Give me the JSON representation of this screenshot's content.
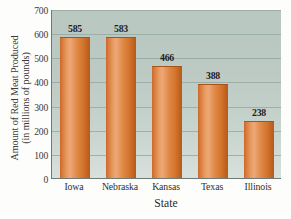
{
  "chart_data": {
    "type": "bar",
    "title": "",
    "categories": [
      "Iowa",
      "Nebraska",
      "Kansas",
      "Texas",
      "Illinois"
    ],
    "values": [
      585,
      583,
      466,
      388,
      238
    ],
    "xlabel": "State",
    "ylabel": "Amount of Red Meat Produced (in millions of pounds)",
    "ylabel_line1": "Amount of Red Meat Produced",
    "ylabel_line2": "(in millions of pounds)",
    "ylim": [
      0,
      700
    ],
    "ytick_labels": [
      "0",
      "100",
      "200",
      "300",
      "400",
      "500",
      "600",
      "700"
    ],
    "ytick_values": [
      0,
      100,
      200,
      300,
      400,
      500,
      600,
      700
    ],
    "grid": true,
    "legend": "none",
    "bar_color": "#d9803f",
    "plot_background_color": "#bccac3",
    "gridline_color": "#98a8a2",
    "axis_color": "#6f7a76",
    "value_labels": [
      "585",
      "583",
      "466",
      "388",
      "238"
    ]
  }
}
